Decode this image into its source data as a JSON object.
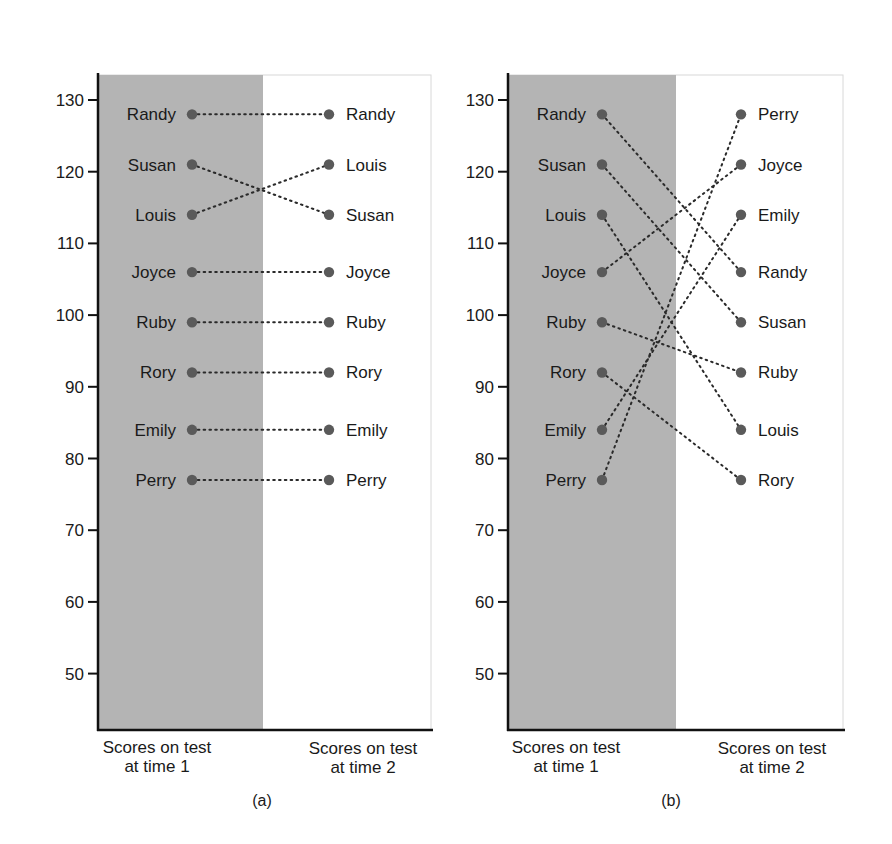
{
  "chart_data": [
    {
      "type": "line",
      "subtype": "slopegraph",
      "title": "High Reliability",
      "panel_label": "(a)",
      "xlabel_left": [
        "Scores on test",
        "at time 1"
      ],
      "xlabel_right": [
        "Scores on test",
        "at time 2"
      ],
      "ylabel": "",
      "ylim": [
        42,
        133
      ],
      "yticks": [
        130,
        120,
        110,
        100,
        90,
        80,
        70,
        60,
        50
      ],
      "grid": false,
      "legend": null,
      "time1": [
        {
          "name": "Randy",
          "score": 128
        },
        {
          "name": "Susan",
          "score": 121
        },
        {
          "name": "Louis",
          "score": 114
        },
        {
          "name": "Joyce",
          "score": 106
        },
        {
          "name": "Ruby",
          "score": 99
        },
        {
          "name": "Rory",
          "score": 92
        },
        {
          "name": "Emily",
          "score": 84
        },
        {
          "name": "Perry",
          "score": 77
        }
      ],
      "time2": [
        {
          "name": "Randy",
          "score": 128
        },
        {
          "name": "Louis",
          "score": 121
        },
        {
          "name": "Susan",
          "score": 114
        },
        {
          "name": "Joyce",
          "score": 106
        },
        {
          "name": "Ruby",
          "score": 99
        },
        {
          "name": "Rory",
          "score": 92
        },
        {
          "name": "Emily",
          "score": 84
        },
        {
          "name": "Perry",
          "score": 77
        }
      ]
    },
    {
      "type": "line",
      "subtype": "slopegraph",
      "title": "Low Reliability",
      "panel_label": "(b)",
      "xlabel_left": [
        "Scores on test",
        "at time 1"
      ],
      "xlabel_right": [
        "Scores on test",
        "at time 2"
      ],
      "ylabel": "",
      "ylim": [
        42,
        133
      ],
      "yticks": [
        130,
        120,
        110,
        100,
        90,
        80,
        70,
        60,
        50
      ],
      "grid": false,
      "legend": null,
      "time1": [
        {
          "name": "Randy",
          "score": 128
        },
        {
          "name": "Susan",
          "score": 121
        },
        {
          "name": "Louis",
          "score": 114
        },
        {
          "name": "Joyce",
          "score": 106
        },
        {
          "name": "Ruby",
          "score": 99
        },
        {
          "name": "Rory",
          "score": 92
        },
        {
          "name": "Emily",
          "score": 84
        },
        {
          "name": "Perry",
          "score": 77
        }
      ],
      "time2": [
        {
          "name": "Perry",
          "score": 128
        },
        {
          "name": "Joyce",
          "score": 121
        },
        {
          "name": "Emily",
          "score": 114
        },
        {
          "name": "Randy",
          "score": 106
        },
        {
          "name": "Susan",
          "score": 99
        },
        {
          "name": "Ruby",
          "score": 92
        },
        {
          "name": "Louis",
          "score": 84
        },
        {
          "name": "Rory",
          "score": 77
        }
      ]
    }
  ],
  "panels": [
    {
      "title": "High Reliability",
      "label": "(a)",
      "xlabel_left_line1": "Scores on test",
      "xlabel_left_line2": "at time 1",
      "xlabel_right_line1": "Scores on test",
      "xlabel_right_line2": "at time 2"
    },
    {
      "title": "Low Reliability",
      "label": "(b)",
      "xlabel_left_line1": "Scores on test",
      "xlabel_left_line2": "at time 1",
      "xlabel_right_line1": "Scores on test",
      "xlabel_right_line2": "at time 2"
    }
  ],
  "colors": {
    "shaded_region": "#b4b4b4",
    "dot": "#5a5a5a",
    "connector": "#2a2a2a",
    "axis": "#111111",
    "frame": "#d8d8d8"
  }
}
